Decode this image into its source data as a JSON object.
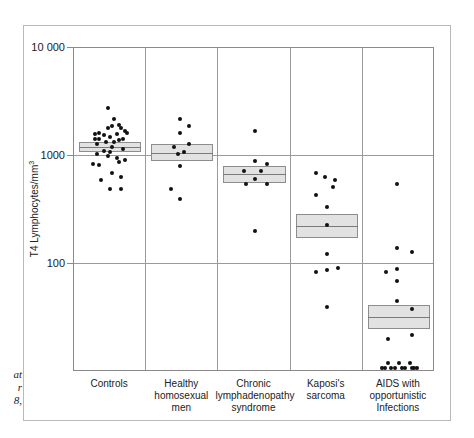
{
  "caption_fragment": [
    "at",
    "r",
    "8,"
  ],
  "chart_data": {
    "type": "scatter",
    "title": "",
    "xlabel": "",
    "ylabel": "T4 Lymphocytes/mm3",
    "ylabel_parts": {
      "text": "T4 Lymphocytes/mm",
      "sup": "3"
    },
    "yscale": "log",
    "ylim": [
      10,
      10000
    ],
    "yticks": [
      {
        "value": 10000,
        "label": "10 000"
      },
      {
        "value": 1000,
        "label": "1000"
      },
      {
        "value": 100,
        "label": "100"
      }
    ],
    "grid": true,
    "categories": [
      {
        "lines": [
          "Controls"
        ]
      },
      {
        "lines": [
          "Healthy",
          "homosexual",
          "men"
        ]
      },
      {
        "lines": [
          "Chronic",
          "lymphadenopathy",
          "syndrome"
        ]
      },
      {
        "lines": [
          "Kaposi's",
          "sarcoma"
        ]
      },
      {
        "lines": [
          "AIDS with",
          "opportunistic",
          "Infections"
        ]
      }
    ],
    "boxes": [
      {
        "category": "Controls",
        "low": 1100,
        "median": 1220,
        "high": 1350
      },
      {
        "category": "Healthy homosexual men",
        "low": 900,
        "median": 1070,
        "high": 1300
      },
      {
        "category": "Chronic lymphadenopathy syndrome",
        "low": 560,
        "median": 680,
        "high": 800
      },
      {
        "category": "Kaposi's sarcoma",
        "low": 175,
        "median": 225,
        "high": 290
      },
      {
        "category": "AIDS with opportunistic infections",
        "low": 25,
        "median": 32,
        "high": 42
      }
    ],
    "series": [
      {
        "name": "Controls",
        "points": [
          [
            -0.05,
            2800
          ],
          [
            0.1,
            2200
          ],
          [
            -0.25,
            1650
          ],
          [
            -0.25,
            1450
          ],
          [
            -0.15,
            1550
          ],
          [
            -0.05,
            1800
          ],
          [
            0.05,
            1900
          ],
          [
            0.2,
            1950
          ],
          [
            0.35,
            1700
          ],
          [
            0.0,
            1500
          ],
          [
            0.15,
            1600
          ],
          [
            0.3,
            1450
          ],
          [
            -0.35,
            1600
          ],
          [
            -0.35,
            1450
          ],
          [
            -0.1,
            1350
          ],
          [
            0.25,
            1800
          ],
          [
            0.05,
            1200
          ],
          [
            -0.3,
            1300
          ],
          [
            0.1,
            1350
          ],
          [
            0.2,
            1400
          ],
          [
            0.4,
            1650
          ],
          [
            0.3,
            1150
          ],
          [
            -0.15,
            1120
          ],
          [
            -0.05,
            1000
          ],
          [
            0.15,
            950
          ],
          [
            0.35,
            920
          ],
          [
            -0.3,
            1050
          ],
          [
            0.0,
            1100
          ],
          [
            -0.4,
            850
          ],
          [
            -0.25,
            820
          ],
          [
            0.2,
            880
          ],
          [
            0.05,
            700
          ],
          [
            0.25,
            640
          ],
          [
            -0.2,
            600
          ],
          [
            0.0,
            500
          ],
          [
            0.25,
            500
          ]
        ]
      },
      {
        "name": "Healthy homosexual men",
        "points": [
          [
            -0.05,
            2200
          ],
          [
            0.15,
            1900
          ],
          [
            -0.05,
            1650
          ],
          [
            0.15,
            1300
          ],
          [
            -0.2,
            1200
          ],
          [
            -0.1,
            1050
          ],
          [
            0.05,
            1100
          ],
          [
            -0.05,
            800
          ],
          [
            -0.25,
            500
          ],
          [
            -0.05,
            400
          ]
        ]
      },
      {
        "name": "Chronic lymphadenopathy syndrome",
        "points": [
          [
            0.0,
            1700
          ],
          [
            0.0,
            900
          ],
          [
            0.3,
            850
          ],
          [
            -0.25,
            720
          ],
          [
            0.15,
            720
          ],
          [
            0.0,
            610
          ],
          [
            -0.2,
            550
          ],
          [
            0.3,
            550
          ],
          [
            0.0,
            200
          ]
        ]
      },
      {
        "name": "Kaposi's sarcoma",
        "points": [
          [
            -0.25,
            700
          ],
          [
            -0.05,
            640
          ],
          [
            0.2,
            600
          ],
          [
            0.15,
            520
          ],
          [
            -0.25,
            440
          ],
          [
            0.0,
            340
          ],
          [
            0.0,
            230
          ],
          [
            0.0,
            125
          ],
          [
            -0.25,
            85
          ],
          [
            0.0,
            88
          ],
          [
            0.25,
            92
          ],
          [
            0.0,
            40
          ]
        ]
      },
      {
        "name": "AIDS with opportunistic infections",
        "points": [
          [
            -0.05,
            550
          ],
          [
            -0.05,
            140
          ],
          [
            0.3,
            130
          ],
          [
            -0.3,
            85
          ],
          [
            -0.05,
            90
          ],
          [
            -0.05,
            70
          ],
          [
            -0.05,
            45
          ],
          [
            0.3,
            38
          ],
          [
            0.3,
            22
          ],
          [
            -0.25,
            20
          ],
          [
            -0.4,
            11
          ],
          [
            -0.25,
            12
          ],
          [
            -0.1,
            11
          ],
          [
            0.0,
            12
          ],
          [
            0.15,
            11
          ],
          [
            0.25,
            12
          ],
          [
            0.35,
            11
          ],
          [
            -0.32,
            10.8
          ],
          [
            -0.18,
            10.9
          ],
          [
            0.08,
            10.8
          ],
          [
            0.3,
            10.9
          ],
          [
            0.42,
            10.8
          ]
        ]
      }
    ]
  }
}
